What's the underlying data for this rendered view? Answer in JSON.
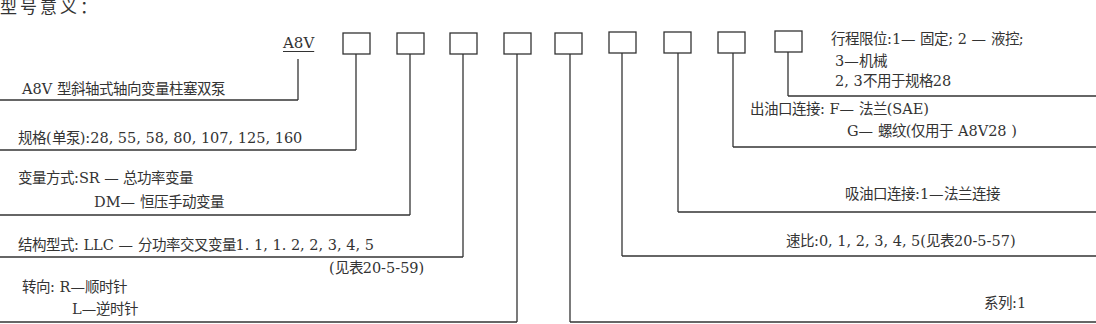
{
  "title": "型号意义：",
  "prefix": "A8V",
  "box_count": 9,
  "legend": {
    "pump_type": "A8V 型斜轴式轴向变量柱塞双泵",
    "size": "规格(单泵):28, 55, 58, 80, 107, 125, 160",
    "control_line1": "变量方式:SR — 总功率变量",
    "control_line2": "DM— 恒压手动变量",
    "structure_line1": "结构型式: LLC — 分功率交叉变量1. 1, 1. 2, 2, 3, 4, 5",
    "structure_line2": "(见表20-5-59)",
    "rotation_line1": "转向: R—顺时针",
    "rotation_line2": "L—逆时针",
    "stroke_limit_line1": "行程限位:1— 固定; 2 — 液控;",
    "stroke_limit_line2": "3—机械",
    "stroke_limit_line3": "2, 3不用于规格28",
    "outlet_line1": "出油口连接: F— 法兰(SAE)",
    "outlet_line2": "G— 螺纹(仅用于 A8V28 )",
    "inlet": "吸油口连接:1—法兰连接",
    "speed_ratio": "速比:0, 1, 2, 3, 4, 5(见表20-5-57)",
    "series": "系列:1"
  }
}
